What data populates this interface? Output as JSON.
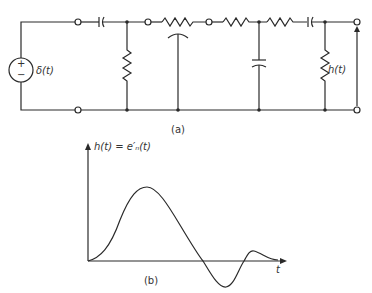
{
  "figure_a": {
    "caption": "(a)",
    "source_label": "δ(t)",
    "source_plus": "+",
    "source_minus": "−",
    "output_label": "h(t)"
  },
  "figure_b": {
    "caption": "(b)",
    "y_label": "h(t) = e′ₙ(t)",
    "x_label": "t"
  },
  "colors": {
    "ink": "#2a2a2a",
    "background": "#ffffff"
  }
}
